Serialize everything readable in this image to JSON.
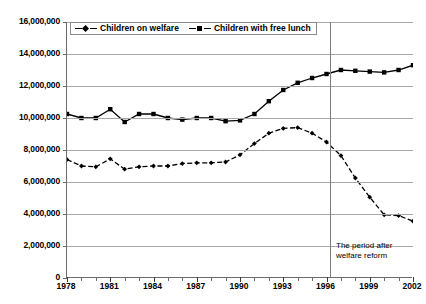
{
  "chart_data": {
    "type": "line",
    "title": "",
    "xlabel": "",
    "ylabel": "",
    "xlim": [
      1978,
      2002
    ],
    "ylim": [
      0,
      16000000
    ],
    "ytick_step": 2000000,
    "grid": true,
    "legend_position": "top-left-inside",
    "x": [
      1978,
      1979,
      1980,
      1981,
      1982,
      1983,
      1984,
      1985,
      1986,
      1987,
      1988,
      1989,
      1990,
      1991,
      1992,
      1993,
      1994,
      1995,
      1996,
      1997,
      1998,
      1999,
      2000,
      2001,
      2002
    ],
    "ytick_labels": [
      "0",
      "2,000,000",
      "4,000,000",
      "6,000,000",
      "8,000,000",
      "10,000,000",
      "12,000,000",
      "14,000,000",
      "16,000,000"
    ],
    "ytick_values": [
      0,
      2000000,
      4000000,
      6000000,
      8000000,
      10000000,
      12000000,
      14000000,
      16000000
    ],
    "xtick_labels": [
      "1978",
      "1981",
      "1984",
      "1987",
      "1990",
      "1993",
      "1996",
      "1999",
      "2002"
    ],
    "xtick_values": [
      1978,
      1981,
      1984,
      1987,
      1990,
      1993,
      1996,
      1999,
      2002
    ],
    "series": [
      {
        "name": "Children on welfare",
        "marker": "diamond",
        "linestyle": "dashed",
        "color": "#000000",
        "values": [
          7400000,
          7000000,
          6950000,
          7450000,
          6800000,
          6950000,
          7000000,
          7000000,
          7150000,
          7200000,
          7200000,
          7250000,
          7700000,
          8400000,
          9050000,
          9350000,
          9400000,
          9050000,
          8500000,
          7650000,
          6250000,
          5050000,
          3950000,
          3900000,
          3550000
        ]
      },
      {
        "name": "Children with free lunch",
        "marker": "square",
        "linestyle": "solid",
        "color": "#000000",
        "values": [
          10250000,
          10000000,
          10000000,
          10550000,
          9750000,
          10250000,
          10250000,
          10000000,
          9900000,
          10000000,
          10000000,
          9800000,
          9850000,
          10250000,
          11050000,
          11750000,
          12200000,
          12500000,
          12750000,
          13000000,
          12950000,
          12900000,
          12850000,
          13000000,
          13300000
        ]
      }
    ],
    "annotations": [
      {
        "text": "The period after welfare reform",
        "x": 1996.5,
        "type": "vertical-reference-line-label"
      }
    ]
  },
  "legend": {
    "entries": [
      {
        "label": "Children on welfare"
      },
      {
        "label": "Children with free lunch"
      }
    ]
  },
  "annotation": {
    "reform_note_line1": "The period after",
    "reform_note_line2": "welfare reform"
  },
  "colors": {
    "line": "#000000",
    "gridline": "#a8a8a8",
    "axis": "#6b6b6b",
    "reform_line": "#7d7d7d",
    "background": "#ffffff"
  }
}
